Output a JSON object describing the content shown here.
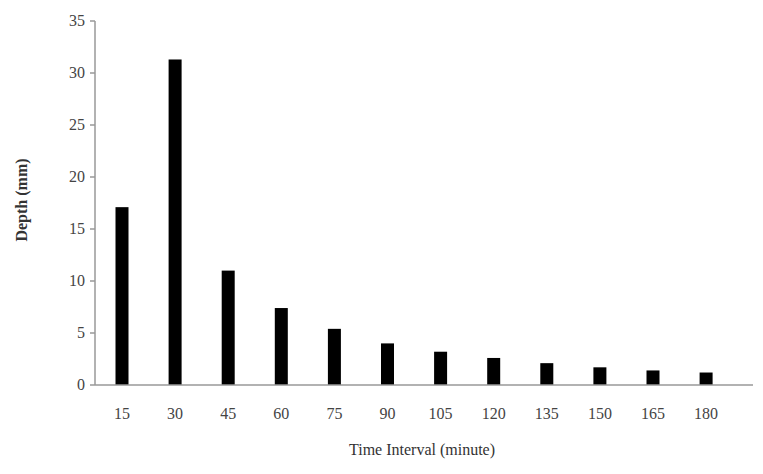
{
  "chart_data": {
    "type": "bar",
    "title": "",
    "xlabel": "Time Interval (minute)",
    "ylabel": "Depth (mm)",
    "categories": [
      "15",
      "30",
      "45",
      "60",
      "75",
      "90",
      "105",
      "120",
      "135",
      "150",
      "165",
      "180"
    ],
    "values": [
      17.1,
      31.3,
      11.0,
      7.4,
      5.4,
      4.0,
      3.2,
      2.6,
      2.1,
      1.7,
      1.4,
      1.2
    ],
    "ylim": [
      0,
      35
    ],
    "yticks": [
      0,
      5,
      10,
      15,
      20,
      25,
      30,
      35
    ],
    "grid": false,
    "legend": null,
    "bar_color": "#000000",
    "axis_color": "#999999"
  }
}
